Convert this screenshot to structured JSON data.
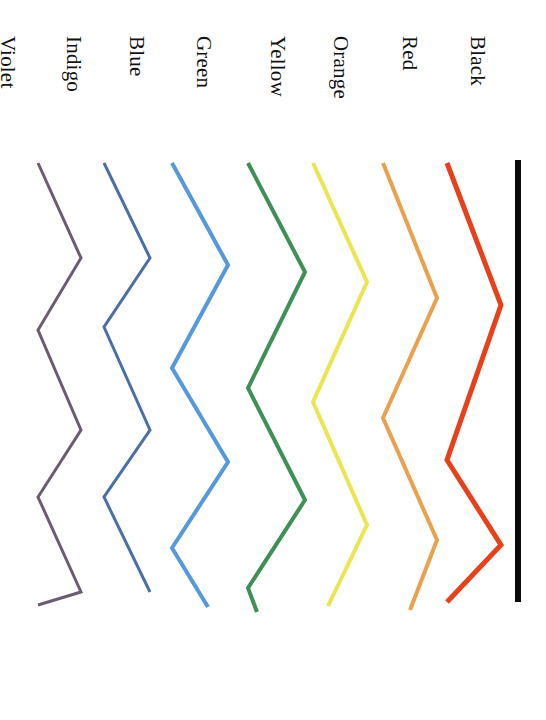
{
  "figure": {
    "background_color": "#ffffff",
    "width": 546,
    "height": 720,
    "label_color": "#111111",
    "label_rotation_deg": 90,
    "orientation_note": "chart rotated 90 degrees; lines run vertically, labels read top-to-bottom"
  },
  "labels": {
    "black": "Black",
    "red": "Red",
    "orange": "Orange",
    "yellow": "Yellow",
    "green": "Green",
    "blue": "Blue",
    "indigo": "Indigo",
    "violet": "Violet"
  },
  "chart_data": {
    "type": "line",
    "title": "",
    "xlabel": "",
    "ylabel": "",
    "grid": false,
    "legend": "inline-top-labels",
    "orientation": "vertical-rotated-90",
    "x": [
      0,
      1,
      2,
      3,
      4,
      5,
      6,
      7,
      8
    ],
    "xlim": [
      0,
      8
    ],
    "ylim": [
      0,
      100
    ],
    "series": [
      {
        "name": "Black",
        "color": "#0a0a0a",
        "line_width": 6,
        "zigzag_cycles": 0,
        "amplitude": 0,
        "values": [
          50,
          50,
          50,
          50,
          50,
          50,
          50,
          50,
          50
        ]
      },
      {
        "name": "Red",
        "color": "#e8401a",
        "line_width": 5,
        "zigzag_cycles": 2,
        "amplitude": 22,
        "values": [
          72,
          55,
          38,
          56,
          74,
          57,
          40,
          56,
          72
        ]
      },
      {
        "name": "Orange",
        "color": "#eba04e",
        "line_width": 4,
        "zigzag_cycles": 2.5,
        "amplitude": 24,
        "values": [
          74,
          52,
          30,
          52,
          74,
          52,
          30,
          52,
          74
        ]
      },
      {
        "name": "Yellow",
        "color": "#eae550",
        "line_width": 4,
        "zigzag_cycles": 2.5,
        "amplitude": 26,
        "values": [
          26,
          50,
          74,
          50,
          26,
          50,
          74,
          50,
          26
        ]
      },
      {
        "name": "Green",
        "color": "#3d9155",
        "line_width": 4,
        "zigzag_cycles": 3,
        "amplitude": 24,
        "values": [
          74,
          50,
          26,
          50,
          74,
          50,
          26,
          50,
          74
        ]
      },
      {
        "name": "Blue",
        "color": "#5599dd",
        "line_width": 4,
        "zigzag_cycles": 3,
        "amplitude": 25,
        "values": [
          25,
          50,
          75,
          50,
          25,
          50,
          75,
          50,
          25
        ]
      },
      {
        "name": "Indigo",
        "color": "#4a6fa5",
        "line_width": 3,
        "zigzag_cycles": 3.5,
        "amplitude": 23,
        "values": [
          73,
          50,
          27,
          50,
          73,
          50,
          27,
          50,
          73
        ]
      },
      {
        "name": "Violet",
        "color": "#6b5b73",
        "line_width": 3,
        "zigzag_cycles": 4,
        "amplitude": 24,
        "values": [
          26,
          50,
          74,
          50,
          26,
          50,
          74,
          50,
          26
        ]
      }
    ]
  },
  "geometry": {
    "plot_top": 160,
    "plot_bottom": 602,
    "lines": [
      {
        "name": "violet",
        "label_x": 18,
        "label_y": 36,
        "points": "38,163 81,258 38,330 81,430 38,497 81,592 38,605"
      },
      {
        "name": "indigo",
        "label_x": 84,
        "label_y": 36,
        "points": "104,163 150,258 104,327 150,430 104,497 150,592"
      },
      {
        "name": "blue",
        "label_x": 147,
        "label_y": 36,
        "points": "172,163 228,265 172,368 228,462 172,548 208,607"
      },
      {
        "name": "green",
        "label_x": 214,
        "label_y": 36,
        "points": "248,163 305,272 248,388 305,500 248,588 257,612"
      },
      {
        "name": "yellow",
        "label_x": 288,
        "label_y": 36,
        "points": "313,163 367,282 313,402 367,525 328,606"
      },
      {
        "name": "orange",
        "label_x": 351,
        "label_y": 36,
        "points": "383,163 437,298 383,418 437,540 410,610"
      },
      {
        "name": "red",
        "label_x": 420,
        "label_y": 36,
        "points": "447,163 501,305 447,460 501,545 447,602"
      },
      {
        "name": "black",
        "label_x": 488,
        "label_y": 36,
        "points": "518,160 518,602"
      }
    ]
  }
}
